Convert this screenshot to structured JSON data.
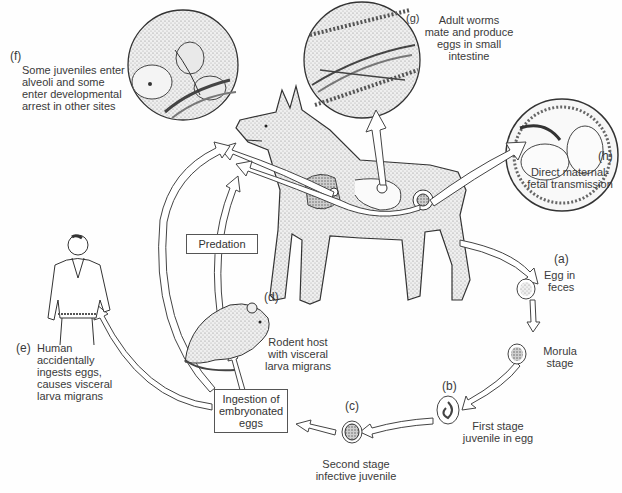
{
  "figure": {
    "type": "parasite-life-cycle",
    "colors": {
      "ink": "#333333",
      "background": "#fefefe",
      "stipple": "#9a9a9a"
    }
  },
  "stages": {
    "a": {
      "tag": "(a)",
      "line1": "Egg in",
      "line2": "feces"
    },
    "morula": {
      "line1": "Morula",
      "line2": "stage"
    },
    "b": {
      "tag": "(b)",
      "line1": "First stage",
      "line2": "juvenile in egg"
    },
    "c": {
      "tag": "(c)",
      "line1": "Second stage",
      "line2": "infective juvenile"
    },
    "d": {
      "tag": "(d)",
      "line1": "Rodent host",
      "line2": "with visceral",
      "line3": "larva migrans"
    },
    "e": {
      "tag": "(e)",
      "line1": "Human",
      "line2": "accidentally",
      "line3": "ingests eggs,",
      "line4": "causes visceral",
      "line5": "larva migrans"
    },
    "f": {
      "tag": "(f)",
      "line1": "Some juveniles enter",
      "line2": "alveoli and some",
      "line3": "enter developmental",
      "line4": "arrest in other sites"
    },
    "g": {
      "tag": "(g)",
      "line1": "Adult worms",
      "line2": "mate and produce",
      "line3": "eggs in small",
      "line4": "intestine"
    },
    "h": {
      "tag": "(h)",
      "line1": "Direct maternal-",
      "line2": "fetal transmission"
    }
  },
  "boxes": {
    "predation": "Predation",
    "ingestion_line1": "Ingestion of",
    "ingestion_line2": "embryonated",
    "ingestion_line3": "eggs"
  },
  "illustrations": [
    "dog-host",
    "lung-alveoli-inset",
    "intestine-inset",
    "fetus-in-uterus-inset",
    "rodent",
    "human-man",
    "egg-stages"
  ]
}
